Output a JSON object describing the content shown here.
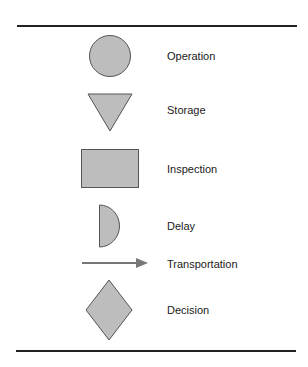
{
  "legend": {
    "items": [
      {
        "symbol": "circle",
        "label": "Operation"
      },
      {
        "symbol": "inverted-triangle",
        "label": "Storage"
      },
      {
        "symbol": "rectangle",
        "label": "Inspection"
      },
      {
        "symbol": "half-circle",
        "label": "Delay"
      },
      {
        "symbol": "arrow",
        "label": "Transportation"
      },
      {
        "symbol": "diamond",
        "label": "Decision"
      }
    ]
  },
  "colors": {
    "shape_fill": "#bdbdbd",
    "shape_stroke": "#555555",
    "arrow": "#777777",
    "rule": "#222222",
    "text": "#1a1a1a"
  }
}
